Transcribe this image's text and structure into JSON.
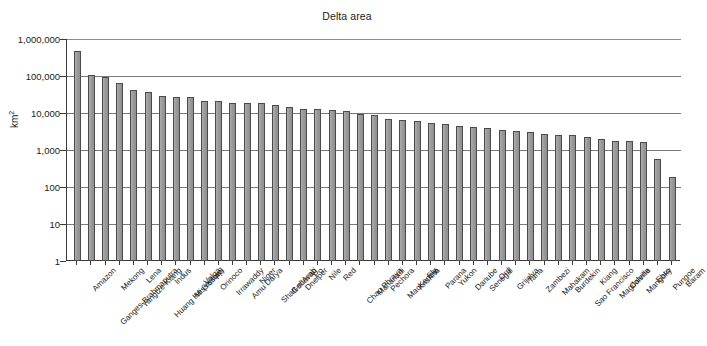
{
  "chart_data": {
    "type": "bar",
    "title": "Delta area",
    "xlabel": "",
    "ylabel": "km2",
    "ylabel_display": "km",
    "ylabel_superscript": "2",
    "yscale": "log",
    "ylim": [
      1,
      1000000
    ],
    "grid": true,
    "legend": "none",
    "ytick_labels": [
      "1,000,000",
      "100,000",
      "10,000",
      "1,000",
      "100",
      "10",
      "1"
    ],
    "ytick_values": [
      1000000,
      100000,
      10000,
      1000,
      100,
      10,
      1
    ],
    "categories": [
      "Amazon",
      "Ganges-Brahmaputra",
      "Mekong",
      "Yangtze-Kiang",
      "Lena",
      "Huang He (Yellow)",
      "Indus",
      "Mississippi",
      "Volga",
      "Orinoco",
      "Irrawaddy",
      "Amu Darya",
      "Niger",
      "Shatt el Arab",
      "Godavari",
      "Dneiper",
      "Po",
      "Nile",
      "Red",
      "Chao Phraya",
      "Mahanadi",
      "Pechora",
      "MacKenzie",
      "Krishna",
      "Fly",
      "Parana",
      "Yukon",
      "Danube",
      "Senegal",
      "Ord",
      "Grijalva",
      "Tana",
      "Zambezi",
      "Mahakam",
      "Burdekin",
      "Sao Francisco",
      "Kiang",
      "Magdalena",
      "Colville",
      "Mangoky",
      "Ebro",
      "Pungoe",
      "Baram"
    ],
    "values": [
      467000,
      105000,
      94000,
      66000,
      43000,
      36000,
      29500,
      27500,
      27000,
      20500,
      20500,
      18500,
      18500,
      18500,
      16500,
      15000,
      13000,
      12500,
      12000,
      11500,
      9500,
      9000,
      7000,
      6400,
      6000,
      5500,
      5000,
      4400,
      4200,
      3900,
      3500,
      3200,
      3000,
      2700,
      2600,
      2500,
      2300,
      2000,
      1800,
      1700,
      1600,
      560,
      190
    ]
  }
}
